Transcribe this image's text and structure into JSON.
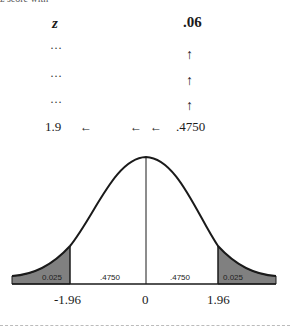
{
  "table": {
    "cut_off_text": "z score with",
    "row_header": "z",
    "column_header": ".06",
    "ellipsis_rows": [
      "…",
      "…",
      "…"
    ],
    "up_arrows": [
      "↑",
      "↑",
      "↑"
    ],
    "lookup_row": {
      "z_value": "1.9",
      "left_arrows": [
        "←",
        "←",
        "←"
      ],
      "table_value": ".4750"
    }
  },
  "diagram": {
    "type": "normal-distribution-curve",
    "axis_labels": [
      "-1.96",
      "0",
      "1.96"
    ],
    "regions": [
      {
        "label": "0.025",
        "shaded": true,
        "side": "left-tail"
      },
      {
        "label": ".4750",
        "shaded": false,
        "side": "left-center"
      },
      {
        "label": ".4750",
        "shaded": false,
        "side": "right-center"
      },
      {
        "label": "0.025",
        "shaded": true,
        "side": "right-tail"
      }
    ],
    "colors": {
      "tail_fill": "#808080",
      "curve_stroke": "#1a1a1a"
    }
  }
}
